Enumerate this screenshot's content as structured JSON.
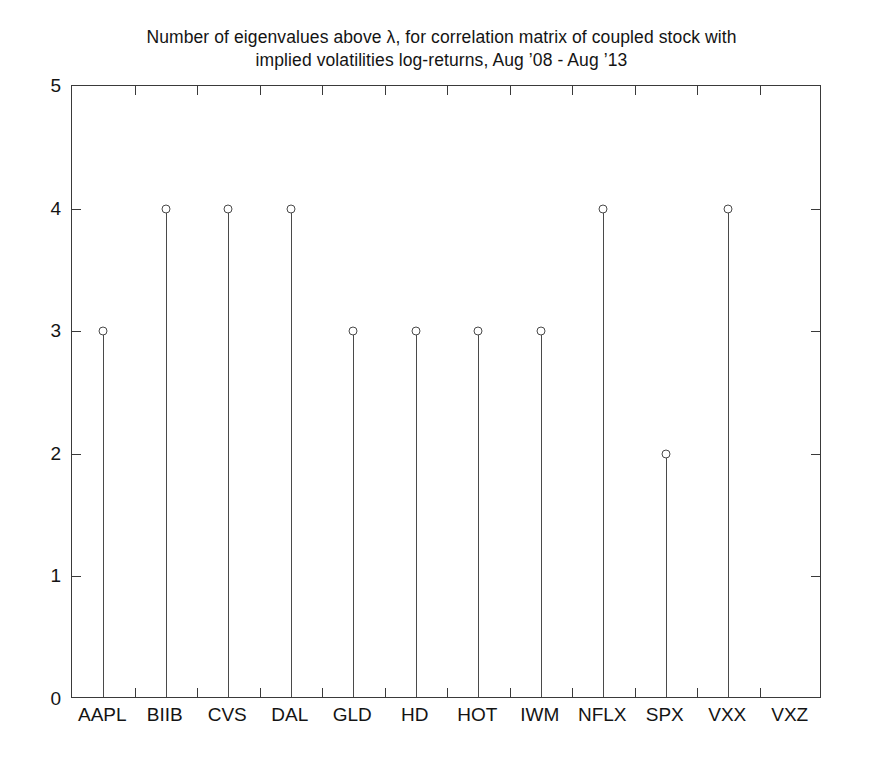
{
  "chart_data": {
    "type": "scatter",
    "plot_style": "stem",
    "title": "Number of eigenvalues above λ, for correlation matrix of coupled stock with\nimplied volatilities log-returns, Aug ’08 - Aug ’13",
    "title_lines": [
      "Number of eigenvalues above λ, for correlation matrix of coupled stock with",
      "implied volatilities log-returns, Aug ’08 - Aug ’13"
    ],
    "xlabel": "",
    "ylabel": "",
    "categories": [
      "AAPL",
      "BIIB",
      "CVS",
      "DAL",
      "GLD",
      "HD",
      "HOT",
      "IWM",
      "NFLX",
      "SPX",
      "VXX",
      "VXZ"
    ],
    "values": [
      3,
      4,
      4,
      4,
      3,
      3,
      3,
      3,
      4,
      2,
      4,
      0
    ],
    "ylim": [
      0,
      5
    ],
    "yticks": [
      0,
      1,
      2,
      3,
      4,
      5
    ],
    "ytick_labels": [
      "0",
      "1",
      "2",
      "3",
      "4",
      "5"
    ],
    "grid": false,
    "legend": null,
    "marker": "open-circle",
    "line_color": "#4a4a4a",
    "axis_color": "#3a3a3a",
    "background": "#ffffff"
  }
}
